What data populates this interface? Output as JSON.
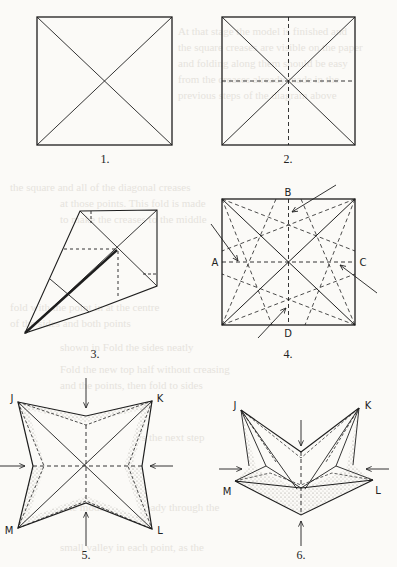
{
  "page": {
    "type": "origami-diagram-page",
    "ink_color": "#1e1e1e",
    "paper_color": "#fbfaf7",
    "shade_color": "#b9b5ad"
  },
  "figures": [
    {
      "number": "1.",
      "description": "square with both diagonals creased"
    },
    {
      "number": "2.",
      "description": "square with diagonals and dashed horizontal/vertical midline creases"
    },
    {
      "number": "3.",
      "description": "kite-shaped partial fold with doubled crease line"
    },
    {
      "number": "4.",
      "description": "square with crease pattern and arrows pushing points A, B, C, D inward"
    },
    {
      "number": "5.",
      "description": "four-pointed star shaped collapse, corners J K L M, arrows at sides"
    },
    {
      "number": "6.",
      "description": "star form being folded upward, corners J K L M, arrows pushing inward"
    }
  ],
  "point_labels": {
    "fig4": {
      "a": "A",
      "b": "B",
      "c": "C",
      "d": "D"
    },
    "fig5": {
      "j": "J",
      "k": "K",
      "l": "L",
      "m": "M"
    },
    "fig6": {
      "j": "J",
      "k": "K",
      "l": "L",
      "m": "M"
    }
  }
}
